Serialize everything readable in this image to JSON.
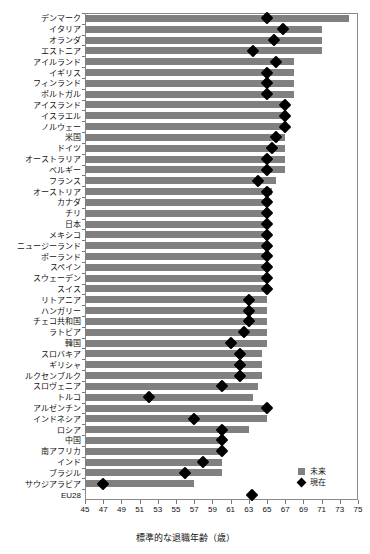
{
  "chart_data": {
    "type": "bar",
    "title": "",
    "subtitle": "",
    "xlabel": "標準的な退職年齢（歳）",
    "ylabel": "",
    "xlim": [
      45,
      75
    ],
    "xticks": [
      45,
      47,
      49,
      51,
      53,
      55,
      57,
      59,
      61,
      63,
      65,
      67,
      69,
      71,
      73,
      75
    ],
    "grid": false,
    "orientation": "horizontal",
    "legend_position": "bottom-right",
    "legend": [
      {
        "label": "未来",
        "marker": "square",
        "color": "#808080"
      },
      {
        "label": "現在",
        "marker": "diamond",
        "color": "#000000"
      }
    ],
    "series": [
      {
        "name": "未来",
        "type": "bar",
        "color": "#808080"
      },
      {
        "name": "現在",
        "type": "point",
        "color": "#000000"
      }
    ],
    "categories": [
      "デンマーク",
      "イタリア",
      "オランダ",
      "エストニア",
      "アイルランド",
      "イギリス",
      "フィンランド",
      "ポルトガル",
      "アイスランド",
      "イスラエル",
      "ノルウェー",
      "米国",
      "ドイツ",
      "オーストラリア",
      "ベルギー",
      "フランス",
      "オーストリア",
      "カナダ",
      "チリ",
      "日本",
      "メキシコ",
      "ニュージーランド",
      "ポーランド",
      "スペイン",
      "スウェーデン",
      "スイス",
      "リトアニア",
      "ハンガリー",
      "チェコ共和国",
      "ラトビア",
      "韓国",
      "スロバキア",
      "ギリシャ",
      "ルクセンブルク",
      "スロヴェニア",
      "トルコ",
      "アルゼンチン",
      "インドネシア",
      "ロシア",
      "中国",
      "南アフリカ",
      "インド",
      "ブラジル",
      "サウジアラビア",
      "EU28"
    ],
    "future_values": [
      74.0,
      71.0,
      71.0,
      71.0,
      68.0,
      68.0,
      68.0,
      68.0,
      67.0,
      67.0,
      67.0,
      67.0,
      67.0,
      67.0,
      67.0,
      66.0,
      65.5,
      65.0,
      65.0,
      65.0,
      65.0,
      65.0,
      65.0,
      65.0,
      65.0,
      65.0,
      65.0,
      65.0,
      65.0,
      65.0,
      65.0,
      64.5,
      64.5,
      64.5,
      64.0,
      63.5,
      65.0,
      65.0,
      63.0,
      60.0,
      60.0,
      60.0,
      60.0,
      57.0,
      null
    ],
    "current_values": [
      65.0,
      66.8,
      65.8,
      63.5,
      66.0,
      65.0,
      65.0,
      65.0,
      67.0,
      67.0,
      67.0,
      66.0,
      65.5,
      65.0,
      65.0,
      64.0,
      65.0,
      65.0,
      65.0,
      65.0,
      65.0,
      65.0,
      65.0,
      65.0,
      65.0,
      65.0,
      63.0,
      63.0,
      63.0,
      62.5,
      61.0,
      62.0,
      62.0,
      62.0,
      60.0,
      52.0,
      65.0,
      57.0,
      60.0,
      60.0,
      60.0,
      58.0,
      56.0,
      47.0,
      63.4
    ],
    "units": "歳"
  }
}
